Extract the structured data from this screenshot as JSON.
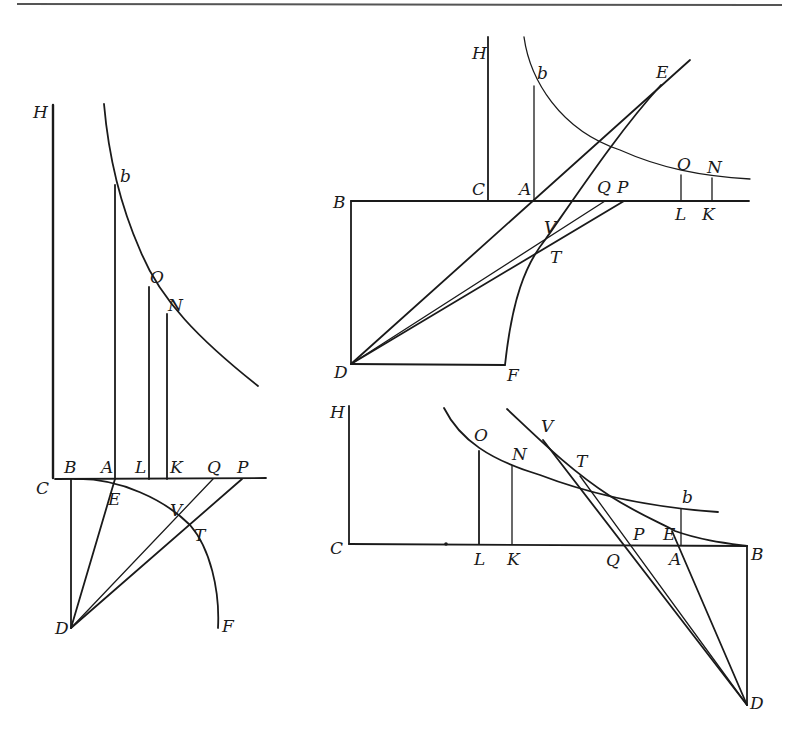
{
  "page": {
    "top_rule": true
  },
  "figures": [
    {
      "id": "left",
      "labels": {
        "H": "H",
        "b": "b",
        "O": "O",
        "N": "N",
        "C": "C",
        "B": "B",
        "A": "A",
        "L": "L",
        "K": "K",
        "Q": "Q",
        "P": "P",
        "E": "E",
        "V": "V",
        "T": "T",
        "D": "D",
        "F": "F"
      }
    },
    {
      "id": "top-right",
      "labels": {
        "H": "H",
        "b": "b",
        "E": "E",
        "O": "O",
        "N": "N",
        "B": "B",
        "C": "C",
        "A": "A",
        "Q": "Q",
        "P": "P",
        "L": "L",
        "K": "K",
        "V": "V",
        "T": "T",
        "D": "D",
        "F": "F"
      }
    },
    {
      "id": "bottom-right",
      "labels": {
        "H": "H",
        "O": "O",
        "V": "V",
        "N": "N",
        "T": "T",
        "b": "b",
        "C": "C",
        "L": "L",
        "K": "K",
        "Q": "Q",
        "P": "P",
        "E": "E",
        "A": "A",
        "B": "B",
        "D": "D"
      }
    }
  ]
}
